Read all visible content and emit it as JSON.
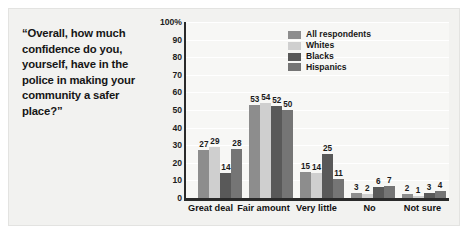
{
  "question": {
    "text": "“Overall, how much confidence do you, yourself, have in the police in making your community a safer place?”"
  },
  "chart_data": {
    "type": "bar",
    "title": "",
    "xlabel": "",
    "ylabel": "",
    "ylim": [
      0,
      100
    ],
    "grid": true,
    "legend_position": "top-right",
    "categories": [
      "Great deal",
      "Fair amount",
      "Very little",
      "No",
      "Not sure"
    ],
    "ytick_labels": [
      "100%",
      "90",
      "80",
      "70",
      "60",
      "50",
      "40",
      "30",
      "20",
      "10",
      "0"
    ],
    "ytick_values": [
      100,
      90,
      80,
      70,
      60,
      50,
      40,
      30,
      20,
      10,
      0
    ],
    "series": [
      {
        "name": "All respondents",
        "color": "#8d8d8d",
        "values": [
          27,
          53,
          15,
          3,
          2
        ]
      },
      {
        "name": "Whites",
        "color": "#cfcfcf",
        "values": [
          29,
          54,
          14,
          2,
          1
        ]
      },
      {
        "name": "Blacks",
        "color": "#595959",
        "values": [
          14,
          52,
          25,
          6,
          3
        ]
      },
      {
        "name": "Hispanics",
        "color": "#757575",
        "values": [
          28,
          50,
          11,
          7,
          4
        ]
      }
    ]
  },
  "legend": {
    "items": [
      {
        "label": "All respondents",
        "color": "#8d8d8d"
      },
      {
        "label": "Whites",
        "color": "#cfcfcf"
      },
      {
        "label": "Blacks",
        "color": "#595959"
      },
      {
        "label": "Hispanics",
        "color": "#757575"
      }
    ]
  }
}
